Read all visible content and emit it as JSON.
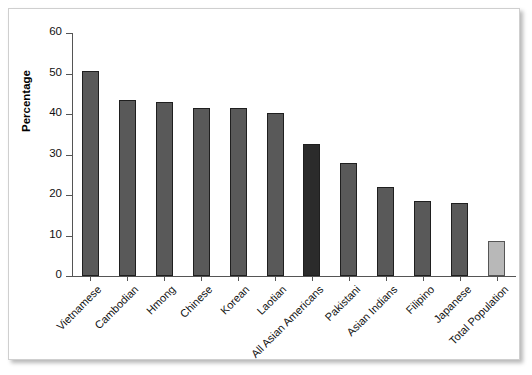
{
  "chart_data": {
    "type": "bar",
    "title": "",
    "xlabel": "",
    "ylabel": "Percentage",
    "ylim": [
      0,
      60
    ],
    "yticks": [
      0,
      10,
      20,
      30,
      40,
      50,
      60
    ],
    "grid": false,
    "legend": null,
    "categories": [
      "Vietnamese",
      "Cambodian",
      "Hmong",
      "Chinese",
      "Korean",
      "Laotian",
      "All Asian Americans",
      "Pakistani",
      "Asian Indians",
      "Filipino",
      "Japanese",
      "Total Population"
    ],
    "values": [
      50.6,
      43.4,
      42.9,
      41.6,
      41.4,
      40.2,
      32.5,
      27.8,
      22.0,
      18.6,
      18.0,
      8.6
    ],
    "bar_colors": [
      "#595959",
      "#595959",
      "#595959",
      "#595959",
      "#595959",
      "#595959",
      "#2b2b2b",
      "#595959",
      "#595959",
      "#595959",
      "#595959",
      "#b8b8b8"
    ],
    "tick_label_rotation": -45
  },
  "axis": {
    "y_title": "Percentage",
    "y_tick_labels": [
      "60",
      "50",
      "40",
      "30",
      "20",
      "10",
      "0"
    ]
  },
  "colors": {
    "bar_default": "#595959",
    "bar_highlight": "#2b2b2b",
    "bar_light": "#b8b8b8",
    "axis": "#555555",
    "panel_border": "#cfcfcf",
    "background": "#ffffff"
  }
}
